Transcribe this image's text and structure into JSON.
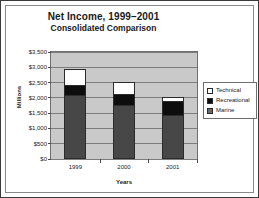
{
  "chart_data": {
    "type": "bar",
    "stacked": true,
    "title": "Net Income, 1999–2001",
    "subtitle": "Consolidated Comparison",
    "xlabel": "Years",
    "ylabel": "Millions",
    "categories": [
      "1999",
      "2000",
      "2001"
    ],
    "series": [
      {
        "name": "Marine",
        "values": [
          2050,
          1730,
          1420
        ],
        "color": "#474747"
      },
      {
        "name": "Recreational",
        "values": [
          350,
          350,
          440
        ],
        "color": "#0d0d0d"
      },
      {
        "name": "Technical",
        "values": [
          525,
          400,
          150
        ],
        "color": "#ffffff"
      }
    ],
    "totals": [
      2925,
      2480,
      2010
    ],
    "ylim": [
      0,
      3500
    ],
    "ytick_values": [
      0,
      500,
      1000,
      1500,
      2000,
      2500,
      3000,
      3500
    ],
    "ytick_labels": [
      "$0",
      "$500",
      "$1,000",
      "$1,500",
      "$2,000",
      "$2,500",
      "$3,000",
      "$3,500"
    ],
    "grid": true,
    "legend_position": "right",
    "legend_order": [
      "Technical",
      "Recreational",
      "Marine"
    ]
  },
  "legend": {
    "items": [
      {
        "label": "Technical"
      },
      {
        "label": "Recreational"
      },
      {
        "label": "Marine"
      }
    ]
  }
}
